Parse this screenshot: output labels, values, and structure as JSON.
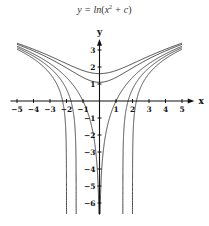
{
  "chart_data": {
    "type": "line",
    "title_parts": {
      "lhs": "y = ln",
      "x": "x",
      "exp": "2",
      "plus_c": " + c"
    },
    "xlabel": "x",
    "ylabel": "y",
    "xlim": [
      -5,
      5
    ],
    "ylim": [
      -6,
      3
    ],
    "x_ticks": [
      -5,
      -4,
      -3,
      -2,
      -1,
      1,
      2,
      3,
      4,
      5
    ],
    "y_ticks": [
      3,
      2,
      1,
      -1,
      -2,
      -3,
      -4,
      -5,
      -6
    ],
    "grid": false,
    "legend": null,
    "series": [
      {
        "name": "c = 5",
        "c": 5,
        "min_y": 1.61
      },
      {
        "name": "c = 3",
        "c": 3,
        "min_y": 1.1
      },
      {
        "name": "c = 0",
        "c": 0,
        "x_intercepts": [
          -1,
          1
        ]
      },
      {
        "name": "c = -2",
        "c": -2,
        "x_intercepts": [
          -1.73,
          1.73
        ],
        "asymptotes": [
          -1.41,
          1.41
        ]
      },
      {
        "name": "c = -4",
        "c": -4,
        "x_intercepts": [
          -2.24,
          2.24
        ],
        "asymptotes": [
          -2,
          2
        ]
      }
    ],
    "line_color": "#333333"
  }
}
